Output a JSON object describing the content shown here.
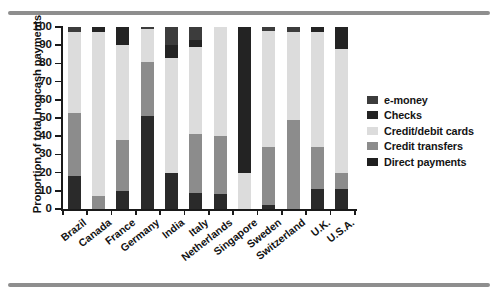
{
  "chart_data": {
    "type": "bar",
    "subtype": "stacked-bar-100",
    "title": "",
    "xlabel": "",
    "ylabel": "Proportion of total noncash payments",
    "ylim": [
      0,
      100
    ],
    "yticks": [
      0,
      10,
      20,
      30,
      40,
      50,
      60,
      70,
      80,
      90,
      100
    ],
    "ytick_labels": [
      "0",
      "10",
      "20",
      "30",
      "40",
      "50",
      "60",
      "70",
      "80",
      "90",
      "100"
    ],
    "grid": false,
    "legend_position": "right",
    "categories": [
      "Brazil",
      "Canada",
      "France",
      "Germany",
      "India",
      "Italy",
      "Netherlands",
      "Singapore",
      "Sweden",
      "Switzerland",
      "U.K.",
      "U.S.A."
    ],
    "series": [
      {
        "name": "Direct payments",
        "color": "#2a2a2a",
        "values": [
          18,
          0,
          10,
          51,
          20,
          9,
          8,
          0,
          2,
          0,
          11,
          11
        ]
      },
      {
        "name": "Credit transfers",
        "color": "#8c8c8c",
        "values": [
          35,
          7,
          28,
          30,
          0,
          32,
          32,
          0,
          32,
          49,
          23,
          9
        ]
      },
      {
        "name": "Credit/debit cards",
        "color": "#dcdcdc",
        "values": [
          44,
          90,
          52,
          18,
          63,
          48,
          60,
          20,
          64,
          48,
          63,
          68
        ]
      },
      {
        "name": "Checks",
        "color": "#232323",
        "values": [
          0,
          3,
          10,
          0,
          7,
          4,
          0,
          80,
          0,
          0,
          3,
          12
        ]
      },
      {
        "name": "e-money",
        "color": "#3c3c3c",
        "values": [
          3,
          0,
          0,
          1,
          10,
          7,
          0,
          0,
          2,
          3,
          0,
          0
        ]
      }
    ],
    "legend_entries": [
      {
        "label": "e-money",
        "color": "#3c3c3c"
      },
      {
        "label": "Checks",
        "color": "#232323"
      },
      {
        "label": "Credit/debit cards",
        "color": "#dcdcdc"
      },
      {
        "label": "Credit transfers",
        "color": "#8c8c8c"
      },
      {
        "label": "Direct payments",
        "color": "#1f1f1f"
      }
    ]
  },
  "axis": {
    "y_title": "Proportion of total noncash payments",
    "y_labels": [
      "100",
      "90",
      "80",
      "70",
      "60",
      "50",
      "40",
      "30",
      "20",
      "10",
      "0"
    ]
  },
  "legend": {
    "items": [
      {
        "label": "e-money"
      },
      {
        "label": "Checks"
      },
      {
        "label": "Credit/debit cards"
      },
      {
        "label": "Credit transfers"
      },
      {
        "label": "Direct payments"
      }
    ]
  },
  "x_labels": [
    "Brazil",
    "Canada",
    "France",
    "Germany",
    "India",
    "Italy",
    "Netherlands",
    "Singapore",
    "Sweden",
    "Switzerland",
    "U.K.",
    "U.S.A."
  ]
}
